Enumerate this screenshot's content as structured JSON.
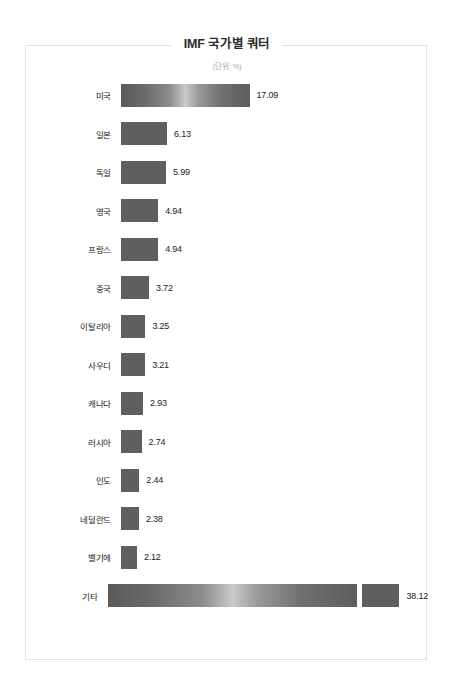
{
  "chart_data": {
    "type": "bar",
    "orientation": "horizontal",
    "title": "IMF 국가별 쿼터",
    "subtitle": "(단위: %)",
    "xlabel": "",
    "ylabel": "",
    "xlim": [
      0,
      38.12
    ],
    "grid": false,
    "legend": "none",
    "bar_color": "#5f5f5f",
    "highlight_color": "#c9c9c9",
    "border_color": "#e2e2e2",
    "categories": [
      "미국",
      "일본",
      "독일",
      "영국",
      "프랑스",
      "중국",
      "이탈리아",
      "사우디",
      "캐나다",
      "러시아",
      "인도",
      "네덜란드",
      "벨기에",
      "기타"
    ],
    "values": [
      17.09,
      6.13,
      5.99,
      4.94,
      4.94,
      3.72,
      3.25,
      3.21,
      2.93,
      2.74,
      2.44,
      2.38,
      2.12,
      38.12
    ],
    "value_labels": [
      "17.09",
      "6.13",
      "5.99",
      "4.94",
      "4.94",
      "3.72",
      "3.25",
      "3.21",
      "2.93",
      "2.74",
      "2.44",
      "2.38",
      "2.12",
      "38.12"
    ],
    "bars": [
      {
        "category": "미국",
        "value": 17.09,
        "label": "17.09",
        "style": "sheen",
        "split": false
      },
      {
        "category": "일본",
        "value": 6.13,
        "label": "6.13",
        "style": "solid",
        "split": false
      },
      {
        "category": "독일",
        "value": 5.99,
        "label": "5.99",
        "style": "solid",
        "split": false
      },
      {
        "category": "영국",
        "value": 4.94,
        "label": "4.94",
        "style": "solid",
        "split": false
      },
      {
        "category": "프랑스",
        "value": 4.94,
        "label": "4.94",
        "style": "solid",
        "split": false
      },
      {
        "category": "중국",
        "value": 3.72,
        "label": "3.72",
        "style": "solid",
        "split": false
      },
      {
        "category": "이탈리아",
        "value": 3.25,
        "label": "3.25",
        "style": "solid",
        "split": false
      },
      {
        "category": "사우디",
        "value": 3.21,
        "label": "3.21",
        "style": "solid",
        "split": false
      },
      {
        "category": "캐나다",
        "value": 2.93,
        "label": "2.93",
        "style": "solid",
        "split": false
      },
      {
        "category": "러시아",
        "value": 2.74,
        "label": "2.74",
        "style": "solid",
        "split": false
      },
      {
        "category": "인도",
        "value": 2.44,
        "label": "2.44",
        "style": "solid",
        "split": false
      },
      {
        "category": "네덜란드",
        "value": 2.38,
        "label": "2.38",
        "style": "solid",
        "split": false
      },
      {
        "category": "벨기에",
        "value": 2.12,
        "label": "2.12",
        "style": "solid",
        "split": false
      },
      {
        "category": "기타",
        "value": 38.12,
        "label": "38.12",
        "style": "sheen",
        "split": true,
        "split_at": 33.2
      }
    ]
  }
}
